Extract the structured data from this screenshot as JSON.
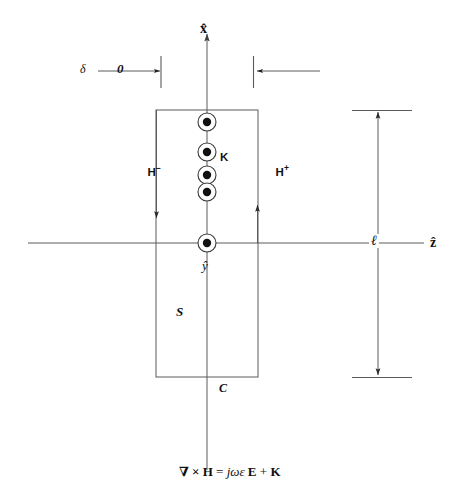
{
  "figure": {
    "background_color": "#ffffff",
    "line_color": "#4a4a4a",
    "text_color": "#111111"
  },
  "axes": {
    "vertical": {
      "label": "x̂",
      "name": "x-hat",
      "direction": "up"
    },
    "horizontal": {
      "label": "ẑ",
      "name": "z-hat",
      "direction": "right"
    },
    "out_of_page": {
      "label": "ŷ",
      "name": "y-hat",
      "direction": "out-of-page"
    }
  },
  "labels": {
    "current_sheet": "K",
    "field_left": "H",
    "field_left_sign": "−",
    "field_right": "H",
    "field_right_sign": "+",
    "surface": "S",
    "contour": "C",
    "length": "ℓ",
    "delta": "δ",
    "arrow_to": "→",
    "zero": "0"
  },
  "equation": {
    "full": "∇ × H = jωε E + K",
    "curl_operator": "∇",
    "cross": "×",
    "h_field": "H",
    "equals": "=",
    "j_omega_epsilon": "jωε",
    "e_field": "E",
    "plus": "+",
    "k_field": "K"
  },
  "geometry": {
    "rectangle": {
      "x": 156,
      "y": 110,
      "width": 102,
      "height": 267
    },
    "origin": {
      "x": 207,
      "y": 243
    },
    "current_dots": [
      {
        "x": 207,
        "y": 122
      },
      {
        "x": 207,
        "y": 152
      },
      {
        "x": 207,
        "y": 175
      },
      {
        "x": 207,
        "y": 192
      },
      {
        "x": 207,
        "y": 243
      }
    ],
    "dot_outer_radius": 9,
    "dot_inner_radius": 4.2
  },
  "annotations": {
    "delta_arrow_description": "delta tends to zero, width measure at left of contour",
    "length_arrow_description": "double-headed dimension arrow of length l spanning contour height"
  }
}
